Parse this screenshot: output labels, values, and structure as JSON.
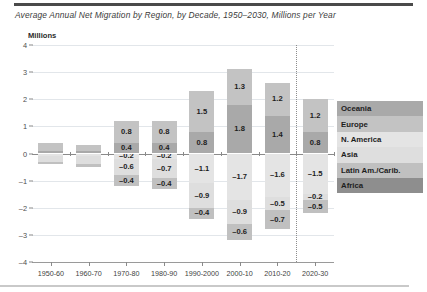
{
  "figure": {
    "title": "Average Annual Net Migration by Region, by Decade, 1950–2030, Millions per Year",
    "unit_label": "Millions"
  },
  "legend": {
    "items": [
      {
        "label": "Oceania",
        "color": "#a9a9a9"
      },
      {
        "label": "Europe",
        "color": "#c3c3c3"
      },
      {
        "label": "N. America",
        "color": "#e4e4e4"
      },
      {
        "label": "Asia",
        "color": "#dedede"
      },
      {
        "label": "Latin Am./Carib.",
        "color": "#c0c0c0"
      },
      {
        "label": "Africa",
        "color": "#8e8e8e"
      }
    ]
  },
  "chart_data": {
    "type": "bar",
    "subtype": "stacked-diverging",
    "title": "Average Annual Net Migration by Region, by Decade, 1950–2030, Millions per Year",
    "xlabel": "",
    "ylabel": "Millions",
    "ylim": [
      -4,
      4
    ],
    "yticks": [
      4,
      3,
      2,
      1,
      0,
      -1,
      -2,
      -3,
      -4
    ],
    "grid": true,
    "legend_position": "right",
    "projection_divider_after": "2010-20",
    "categories": [
      "1950-60",
      "1960-70",
      "1970-80",
      "1980-90",
      "1990-2000",
      "2000-10",
      "2010-20",
      "2020-30"
    ],
    "series": [
      {
        "name": "Oceania",
        "values": [
          0.1,
          0.1,
          0.4,
          0.4,
          0.8,
          1.8,
          1.4,
          0.8
        ]
      },
      {
        "name": "Europe",
        "values": [
          0.3,
          0.2,
          0.8,
          0.8,
          1.5,
          1.3,
          1.2,
          1.2
        ]
      },
      {
        "name": "N. America",
        "values": [
          -0.1,
          -0.1,
          -0.2,
          -0.2,
          -1.1,
          -1.7,
          -1.6,
          -1.5
        ]
      },
      {
        "name": "Asia",
        "values": [
          -0.2,
          -0.3,
          -0.6,
          -0.7,
          -0.9,
          -0.9,
          -0.5,
          -0.2
        ]
      },
      {
        "name": "Latin Am./Carib.",
        "values": [
          -0.1,
          -0.1,
          -0.4,
          -0.4,
          -0.4,
          -0.6,
          -0.7,
          -0.5
        ]
      }
    ],
    "labels": {
      "1950-60": {
        "Oceania": "",
        "Europe": "",
        "N. America": "",
        "Asia": "",
        "Latin Am./Carib.": ""
      },
      "1960-70": {
        "Oceania": "",
        "Europe": "",
        "N. America": "",
        "Asia": "",
        "Latin Am./Carib.": ""
      },
      "1970-80": {
        "Oceania": "0.4",
        "Europe": "0.8",
        "N. America": "–0.2",
        "Asia": "–0.6",
        "Latin Am./Carib.": "–0.4"
      },
      "1980-90": {
        "Oceania": "0.4",
        "Europe": "0.8",
        "N. America": "–0.2",
        "Asia": "–0.7",
        "Latin Am./Carib.": "–0.4"
      },
      "1990-2000": {
        "Oceania": "0.8",
        "Europe": "1.5",
        "N. America": "–1.1",
        "Asia": "–0.9",
        "Latin Am./Carib.": "–0.4"
      },
      "2000-10": {
        "Oceania": "1.8",
        "Europe": "1.3",
        "N. America": "–1.7",
        "Asia": "–0.9",
        "Latin Am./Carib.": "–0.6"
      },
      "2010-20": {
        "Oceania": "1.4",
        "Europe": "1.2",
        "N. America": "–1.6",
        "Asia": "–0.5",
        "Latin Am./Carib.": "–0.7"
      },
      "2020-30": {
        "Oceania": "0.8",
        "Europe": "1.2",
        "N. America": "–1.5",
        "Asia": "–0.2",
        "Latin Am./Carib.": "–0.5"
      }
    },
    "ytick_labels": [
      "4",
      "3",
      "2",
      "1",
      "0",
      "–1",
      "–2",
      "–3",
      "–4"
    ]
  }
}
